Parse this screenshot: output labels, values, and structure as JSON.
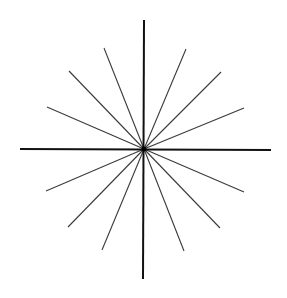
{
  "diagram": {
    "type": "starburst",
    "background": "#ffffff",
    "center": {
      "x": 144,
      "y": 149
    },
    "axis_color": "#111111",
    "axis_width": 2,
    "ray_color": "#3a3a3a",
    "ray_width": 1.1,
    "axes": [
      {
        "name": "vertical-axis",
        "x1": 144,
        "y1": 20,
        "x2": 143,
        "y2": 279
      },
      {
        "name": "horizontal-axis",
        "x1": 20,
        "y1": 149,
        "x2": 271,
        "y2": 150
      }
    ],
    "rays": [
      {
        "name": "ray-upper-left-1",
        "x": 104,
        "y": 48
      },
      {
        "name": "ray-upper-left-2",
        "x": 69,
        "y": 71
      },
      {
        "name": "ray-upper-left-3",
        "x": 47,
        "y": 107
      },
      {
        "name": "ray-upper-right-1",
        "x": 186,
        "y": 49
      },
      {
        "name": "ray-upper-right-2",
        "x": 221,
        "y": 72
      },
      {
        "name": "ray-upper-right-3",
        "x": 244,
        "y": 108
      },
      {
        "name": "ray-lower-left-1",
        "x": 46,
        "y": 191
      },
      {
        "name": "ray-lower-left-2",
        "x": 68,
        "y": 227
      },
      {
        "name": "ray-lower-left-3",
        "x": 102,
        "y": 250
      },
      {
        "name": "ray-lower-right-1",
        "x": 244,
        "y": 192
      },
      {
        "name": "ray-lower-right-2",
        "x": 220,
        "y": 228
      },
      {
        "name": "ray-lower-right-3",
        "x": 184,
        "y": 251
      }
    ]
  }
}
